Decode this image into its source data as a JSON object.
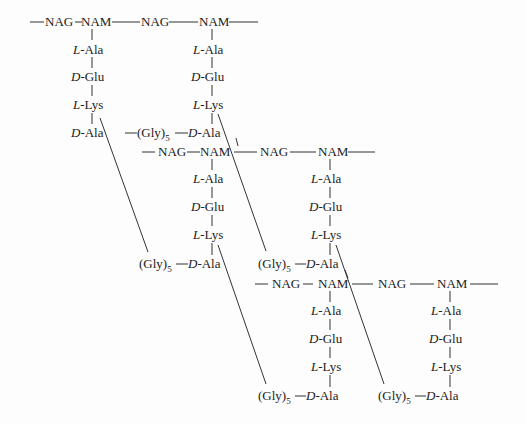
{
  "labels": {
    "nag": "NAG",
    "nam": "NAM",
    "l": "L",
    "d": "D",
    "ala": "-Ala",
    "glu": "-Glu",
    "lys": "-Lys",
    "gly": "(Gly)",
    "gly_sub": "5"
  },
  "layers": [
    {
      "y": 22,
      "units": [
        "NAG",
        "NAM",
        "NAG",
        "NAM"
      ]
    },
    {
      "y": 152,
      "units": [
        "NAG",
        "NAM",
        "NAG",
        "NAM"
      ]
    },
    {
      "y": 284,
      "units": [
        "NAG",
        "NAM",
        "NAG",
        "NAM"
      ]
    }
  ],
  "stem_peptide": [
    "L-Ala",
    "D-Glu",
    "L-Lys",
    "D-Ala"
  ],
  "crossbridge": "(Gly)5"
}
